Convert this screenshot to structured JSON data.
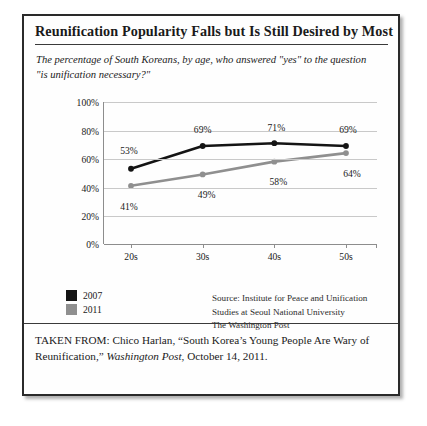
{
  "figure": {
    "title": "Reunification Popularity Falls but Is Still Desired by Most",
    "subtitle": "The percentage of South Koreans, by age, who answered \"yes\" to the question \"is unification necessary?\"",
    "source_lines": [
      "Source: Institute for Peace and Unification",
      "Studies at Seoul National University",
      "The Washington Post"
    ],
    "taken_from": {
      "prefix": "TAKEN FROM: Chico Harlan, “South Korea’s Young People Are Wary of Reunification,” ",
      "italic": "Washington Post",
      "suffix": ", October 14, 2011."
    }
  },
  "chart_data": {
    "type": "line",
    "title": "Reunification Popularity Falls but Is Still Desired by Most",
    "subtitle": "The percentage of South Koreans, by age, who answered \"yes\" to the question \"is unification necessary?\"",
    "xlabel": "",
    "ylabel": "",
    "categories": [
      "20s",
      "30s",
      "40s",
      "50s"
    ],
    "ylim": [
      0,
      100
    ],
    "yticks": [
      "0%",
      "20%",
      "40%",
      "60%",
      "80%",
      "100%"
    ],
    "ytick_values": [
      0,
      20,
      40,
      60,
      80,
      100
    ],
    "grid": true,
    "legend_position": "bottom-left",
    "series": [
      {
        "name": "2007",
        "color": "#141414",
        "values": [
          53,
          69,
          71,
          69
        ],
        "labels": [
          "53%",
          "69%",
          "71%",
          "69%"
        ]
      },
      {
        "name": "2011",
        "color": "#8f8f8f",
        "values": [
          41,
          49,
          58,
          64
        ],
        "labels": [
          "41%",
          "49%",
          "58%",
          "64%"
        ]
      }
    ]
  }
}
